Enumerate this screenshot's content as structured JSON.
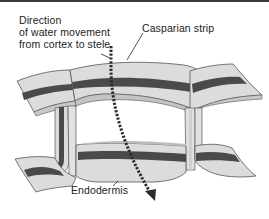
{
  "diagram": {
    "labels": {
      "direction_lines": [
        "Direction",
        "of water movement",
        "from cortex to stele"
      ],
      "casparian_strip": "Casparian strip",
      "endodermis": "Endodermis"
    },
    "arrow": {
      "style": "dotted",
      "meaning": "water movement from cortex to stele"
    },
    "colors": {
      "cell_wall_fill": "#d9d9d9",
      "cell_wall_light": "#e8e8e8",
      "casparian_band": "#4a4a4a",
      "outline": "#555555",
      "arrow": "#2b2b2b",
      "text": "#222222",
      "top_border": "#3a3a3a"
    }
  }
}
